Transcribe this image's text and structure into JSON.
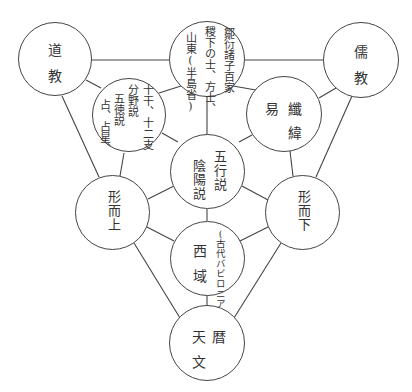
{
  "diagram": {
    "nodes": {
      "taoism": {
        "chars": [
          "道",
          "教"
        ]
      },
      "confucianism": {
        "chars": [
          "儒",
          "教"
        ]
      },
      "zou_yan": {
        "lines": [
          "鄒衍諸子百家",
          "稷下の士、方士、",
          "山東(半島省)"
        ]
      },
      "ganzhi": {
        "lines": [
          "十干、十二支",
          "分野説",
          "五徳説",
          "占、占星、"
        ]
      },
      "yiweiwei": {
        "chars": [
          "易",
          "纖",
          "緯"
        ]
      },
      "wuxing": {
        "lines": [
          "五行説",
          "陰陽説"
        ]
      },
      "metaphysical": {
        "text": "形而上"
      },
      "physical": {
        "text": "形而下"
      },
      "western_regions": {
        "chars": [
          "西",
          "域"
        ],
        "note": "(古代バビロニア)"
      },
      "astronomy": {
        "chars": [
          "天",
          "暦",
          "文"
        ]
      }
    },
    "edges": [
      [
        "taoism",
        "zou_yan"
      ],
      [
        "zou_yan",
        "confucianism"
      ],
      [
        "taoism",
        "ganzhi"
      ],
      [
        "taoism",
        "metaphysical"
      ],
      [
        "confucianism",
        "yiweiwei"
      ],
      [
        "confucianism",
        "physical"
      ],
      [
        "zou_yan",
        "ganzhi"
      ],
      [
        "zou_yan",
        "yiweiwei"
      ],
      [
        "zou_yan",
        "wuxing"
      ],
      [
        "ganzhi",
        "wuxing"
      ],
      [
        "ganzhi",
        "metaphysical"
      ],
      [
        "yiweiwei",
        "wuxing"
      ],
      [
        "yiweiwei",
        "physical"
      ],
      [
        "wuxing",
        "metaphysical"
      ],
      [
        "wuxing",
        "physical"
      ],
      [
        "wuxing",
        "western_regions"
      ],
      [
        "metaphysical",
        "western_regions"
      ],
      [
        "physical",
        "western_regions"
      ],
      [
        "metaphysical",
        "astronomy"
      ],
      [
        "physical",
        "astronomy"
      ],
      [
        "western_regions",
        "astronomy"
      ]
    ]
  }
}
